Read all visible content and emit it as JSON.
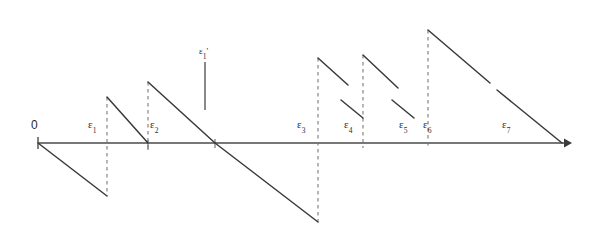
{
  "figure": {
    "title": "",
    "kind": "piecewise-linear sawtooth diagram on a number line",
    "axis": {
      "name": "horizontal-axis",
      "y": 143,
      "x_start": 38,
      "x_end": 568,
      "arrow": "right",
      "color": "#4a4a4a"
    },
    "origin_label": "0",
    "tick_labels": [
      {
        "id": "e1",
        "text": "ε",
        "sub": "1",
        "x": 90,
        "y": 118
      },
      {
        "id": "e2",
        "text": "ε",
        "sub": "2",
        "x": 152,
        "y": 118
      },
      {
        "id": "e3",
        "text": "ε",
        "sub": "3",
        "x": 298,
        "y": 118
      },
      {
        "id": "e4",
        "text": "ε",
        "sub": "4",
        "x": 345,
        "y": 118
      },
      {
        "id": "e5",
        "text": "ε",
        "sub": "5",
        "x": 400,
        "y": 118
      },
      {
        "id": "e6",
        "text": "ε",
        "sub": "6",
        "x": 424,
        "y": 118
      },
      {
        "id": "e7",
        "text": "ε",
        "sub": "7",
        "x": 503,
        "y": 118
      }
    ],
    "floating_label": {
      "id": "e1-prime",
      "text": "ε",
      "sub": "1",
      "prime": "'",
      "x": 200,
      "y": 48
    },
    "dashed_verticals": [
      {
        "id": "dash-e1",
        "x": 107,
        "y_top": 97,
        "y_bottom": 196
      },
      {
        "id": "dash-e2",
        "x": 148,
        "y_top": 82,
        "y_bottom": 152
      },
      {
        "id": "dash-e3",
        "x": 318,
        "y_top": 58,
        "y_bottom": 222
      },
      {
        "id": "dash-e4",
        "x": 363,
        "y_top": 55,
        "y_bottom": 148
      },
      {
        "id": "dash-e6",
        "x": 428,
        "y_top": 30,
        "y_bottom": 148
      }
    ],
    "solid_marker_line": {
      "id": "marker-e1-prime",
      "x": 205,
      "y_top": 62,
      "y_bottom": 110
    },
    "curve_segments": [
      {
        "id": "seg-0-down",
        "points": "38,143 107,196"
      },
      {
        "id": "seg-1-up",
        "points": "107,97 107,97"
      },
      {
        "id": "seg-1-down",
        "points": "107,97 148,143"
      },
      {
        "id": "seg-2-down",
        "points": "148,82 215,143"
      },
      {
        "id": "seg-2-long",
        "points": "215,143 318,222"
      },
      {
        "id": "seg-3-down",
        "points": "318,58 345,82"
      },
      {
        "id": "seg-4-up",
        "points": "345,100 363,100"
      },
      {
        "id": "seg-4-down",
        "points": "363,55 395,85"
      },
      {
        "id": "seg-5-down",
        "points": "395,100 428,112"
      },
      {
        "id": "seg-6-down",
        "points": "428,30 568,143"
      }
    ],
    "stroke_color": "#3a3a3a",
    "dash_color": "#6a6a6a",
    "background": "#ffffff"
  }
}
